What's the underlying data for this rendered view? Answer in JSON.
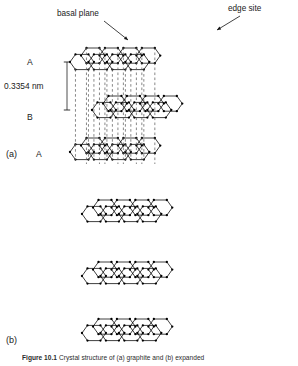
{
  "figure": {
    "domain": "scientific-diagram",
    "background_color": "#ffffff",
    "line_color": "#000000",
    "atom_color": "#000000",
    "dash_color": "#555555"
  },
  "annotations": {
    "basal_plane": "basal plane",
    "edge_site": "edge site"
  },
  "stacking": {
    "layer_top": "A",
    "layer_middle": "B",
    "layer_bottom": "A",
    "interlayer_spacing": "0.3354 nm"
  },
  "panels": {
    "a": "(a)",
    "b": "(b)"
  },
  "caption": {
    "prefix": "Figure 10.1",
    "text": "Crystal structure of (a) graphite and (b) expanded"
  },
  "chart_data": {
    "type": "diagram",
    "panel_a": {
      "label": "(a)",
      "description": "AB-stacked graphite lattice, three hexagonal carbon layers in oblique projection joined by vertical dashed registry lines",
      "layers": [
        {
          "stack_letter": "A",
          "rows": 2,
          "cols": 4,
          "offset_x": 0,
          "y_base": 62
        },
        {
          "stack_letter": "B",
          "rows": 2,
          "cols": 4,
          "offset_x": 22,
          "y_base": 110
        },
        {
          "stack_letter": "A",
          "rows": 2,
          "cols": 4,
          "offset_x": 0,
          "y_base": 152
        }
      ],
      "dimension": {
        "value": "0.3354 nm",
        "from_layer": "A",
        "to_layer": "B"
      },
      "callouts": [
        {
          "label": "basal plane",
          "points_to": "top-layer-face"
        },
        {
          "label": "edge site",
          "points_to": "right-edge-vertex"
        }
      ]
    },
    "panel_b": {
      "label": "(b)",
      "description": "Three separated (exfoliated) graphene sheets without interlayer registry lines",
      "sheets": 3,
      "rows_per_sheet": 2,
      "cols_per_sheet": 4
    },
    "geometry": {
      "hex_dx": 13.0,
      "hex_dy": 7.6,
      "shear_x": 11.0,
      "shear_y": -6.4
    }
  }
}
